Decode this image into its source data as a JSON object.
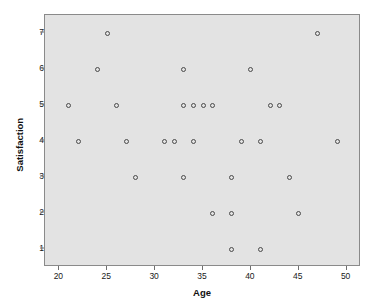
{
  "chart_data": {
    "type": "scatter",
    "title": "",
    "xlabel": "Age",
    "ylabel": "Satisfaction",
    "xlim": [
      18.5,
      51.5
    ],
    "ylim": [
      0.5,
      7.5
    ],
    "grid": false,
    "legend": null,
    "xticks": [
      20,
      25,
      30,
      35,
      40,
      45,
      50
    ],
    "xtick_labels": [
      "20",
      "25",
      "30",
      "35",
      "40",
      "45",
      "50"
    ],
    "yticks": [
      1,
      2,
      3,
      4,
      5,
      6,
      7
    ],
    "ytick_labels": [
      "1",
      "2",
      "3",
      "4",
      "5",
      "6",
      "7"
    ],
    "marker": "open-circle",
    "marker_color": "#4a4a4a",
    "plot_background": "#e3e3e3",
    "figure_background": "#ffffff",
    "n_points": 30,
    "x": [
      25,
      47,
      24,
      33,
      40,
      21,
      26,
      33,
      34,
      35,
      36,
      42,
      43,
      22,
      27,
      31,
      32,
      34,
      39,
      41,
      49,
      28,
      33,
      38,
      44,
      36,
      38,
      45,
      38,
      41
    ],
    "y": [
      7,
      7,
      6,
      6,
      6,
      5,
      5,
      5,
      5,
      5,
      5,
      5,
      5,
      4,
      4,
      4,
      4,
      4,
      4,
      4,
      4,
      3,
      3,
      3,
      3,
      2,
      2,
      2,
      1,
      1
    ],
    "points": [
      {
        "x": 25,
        "y": 7
      },
      {
        "x": 47,
        "y": 7
      },
      {
        "x": 24,
        "y": 6
      },
      {
        "x": 33,
        "y": 6
      },
      {
        "x": 40,
        "y": 6
      },
      {
        "x": 21,
        "y": 5
      },
      {
        "x": 26,
        "y": 5
      },
      {
        "x": 33,
        "y": 5
      },
      {
        "x": 34,
        "y": 5
      },
      {
        "x": 35,
        "y": 5
      },
      {
        "x": 36,
        "y": 5
      },
      {
        "x": 42,
        "y": 5
      },
      {
        "x": 43,
        "y": 5
      },
      {
        "x": 22,
        "y": 4
      },
      {
        "x": 27,
        "y": 4
      },
      {
        "x": 31,
        "y": 4
      },
      {
        "x": 32,
        "y": 4
      },
      {
        "x": 34,
        "y": 4
      },
      {
        "x": 39,
        "y": 4
      },
      {
        "x": 41,
        "y": 4
      },
      {
        "x": 49,
        "y": 4
      },
      {
        "x": 28,
        "y": 3
      },
      {
        "x": 33,
        "y": 3
      },
      {
        "x": 38,
        "y": 3
      },
      {
        "x": 44,
        "y": 3
      },
      {
        "x": 36,
        "y": 2
      },
      {
        "x": 38,
        "y": 2
      },
      {
        "x": 45,
        "y": 2
      },
      {
        "x": 38,
        "y": 1
      },
      {
        "x": 41,
        "y": 1
      }
    ]
  }
}
